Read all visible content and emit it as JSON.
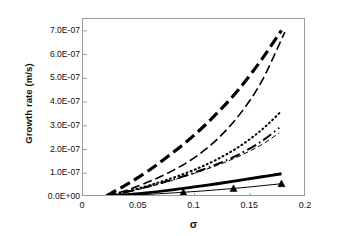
{
  "chart_data": {
    "type": "line",
    "title": "",
    "xlabel": "σ",
    "ylabel": "Growth rate (m/s)",
    "xlim": [
      0,
      0.2
    ],
    "ylim": [
      0,
      7.5e-07
    ],
    "xticks": [
      "0",
      "0.05",
      "0.1",
      "0.15",
      "0.2"
    ],
    "xtick_values": [
      0,
      0.05,
      0.1,
      0.15,
      0.2
    ],
    "yticks": [
      "0.0E+00",
      "1.0E-07",
      "2.0E-07",
      "3.0E-07",
      "4.0E-07",
      "5.0E-07",
      "6.0E-07",
      "7.0E-07"
    ],
    "ytick_values": [
      0,
      1e-07,
      2e-07,
      3e-07,
      4e-07,
      5e-07,
      6e-07,
      7e-07
    ],
    "grid": false,
    "legend": "none",
    "background": "#ffffff",
    "frame_color": "#9a9a9a",
    "line_color": "#000000",
    "series": [
      {
        "name": "series-1-thick-long-dash",
        "style": "thick-long-dash",
        "width": 3.2,
        "dash": "11,5",
        "marker": "none",
        "x": [
          0.021,
          0.04,
          0.06,
          0.08,
          0.1,
          0.12,
          0.14,
          0.16,
          0.178
        ],
        "y": [
          5e-09,
          5.5e-08,
          1.15e-07,
          1.85e-07,
          2.62e-07,
          3.52e-07,
          4.55e-07,
          5.78e-07,
          7.02e-07
        ]
      },
      {
        "name": "series-2-thin-medium-dash",
        "style": "thin-medium-dash",
        "width": 1.6,
        "dash": "9,4",
        "marker": "none",
        "x": [
          0.021,
          0.04,
          0.06,
          0.08,
          0.1,
          0.12,
          0.14,
          0.16,
          0.181
        ],
        "y": [
          4e-09,
          3e-08,
          6.6e-08,
          1.1e-07,
          1.66e-07,
          2.42e-07,
          3.45e-07,
          4.85e-07,
          6.95e-07
        ]
      },
      {
        "name": "series-3-dotted",
        "style": "dotted",
        "width": 2.0,
        "dash": "1,3.4",
        "marker": "none",
        "x": [
          0.021,
          0.04,
          0.06,
          0.08,
          0.1,
          0.12,
          0.14,
          0.16,
          0.178
        ],
        "y": [
          3e-09,
          2.4e-08,
          5e-08,
          8e-08,
          1.15e-07,
          1.58e-07,
          2.12e-07,
          2.82e-07,
          3.62e-07
        ]
      },
      {
        "name": "series-4-dash-dot",
        "style": "dash-dot",
        "width": 1.9,
        "dash": "10,3.5,1.6,3.5",
        "marker": "none",
        "x": [
          0.021,
          0.04,
          0.06,
          0.08,
          0.1,
          0.12,
          0.14,
          0.16,
          0.176
        ],
        "y": [
          3e-09,
          2.2e-08,
          4.6e-08,
          7.3e-08,
          1.03e-07,
          1.38e-07,
          1.8e-07,
          2.34e-07,
          2.92e-07
        ]
      },
      {
        "name": "series-5-thin-light-dash",
        "style": "thin-light-dash",
        "width": 1.0,
        "dash": "5,3",
        "marker": "none",
        "x": [
          0.021,
          0.04,
          0.06,
          0.08,
          0.1,
          0.12,
          0.14,
          0.16,
          0.176
        ],
        "y": [
          2e-09,
          2e-08,
          4.4e-08,
          7e-08,
          1e-07,
          1.33e-07,
          1.72e-07,
          2.2e-07,
          2.7e-07
        ]
      },
      {
        "name": "series-6-thick-solid",
        "style": "thick-solid",
        "width": 3.0,
        "dash": "none",
        "marker": "none",
        "x": [
          0.021,
          0.05,
          0.08,
          0.11,
          0.14,
          0.162,
          0.178
        ],
        "y": [
          1e-09,
          1.4e-08,
          3e-08,
          4.9e-08,
          7e-08,
          8.6e-08,
          9.8e-08
        ]
      },
      {
        "name": "series-7-thin-solid-triangles",
        "style": "thin-solid-triangle",
        "width": 1.0,
        "dash": "none",
        "marker": "triangle",
        "x": [
          0.021,
          0.09,
          0.135,
          0.178
        ],
        "y": [
          1e-09,
          2e-08,
          3.6e-08,
          5.6e-08
        ]
      }
    ]
  }
}
